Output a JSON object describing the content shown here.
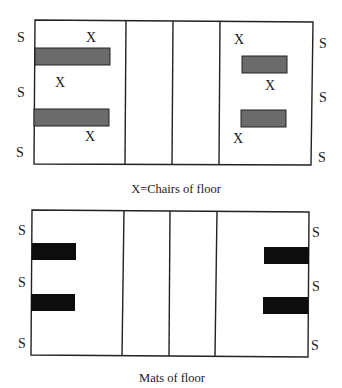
{
  "diagram_top": {
    "caption": "X=Chairs of floor",
    "side_label": "S",
    "chair_label": "X",
    "mat_color": "#6b6b6b",
    "left_side_labels": [
      "S",
      "S",
      "S"
    ],
    "right_side_labels": [
      "S",
      "S",
      "S"
    ],
    "chairs": [
      "X",
      "X",
      "X",
      "X",
      "X",
      "X"
    ],
    "mats_count": 4
  },
  "diagram_bottom": {
    "caption": "Mats of floor",
    "side_label": "S",
    "mat_color": "#0d0d0d",
    "left_side_labels": [
      "S",
      "S",
      "S"
    ],
    "right_side_labels": [
      "S",
      "S",
      "S"
    ],
    "mats_count": 4
  }
}
